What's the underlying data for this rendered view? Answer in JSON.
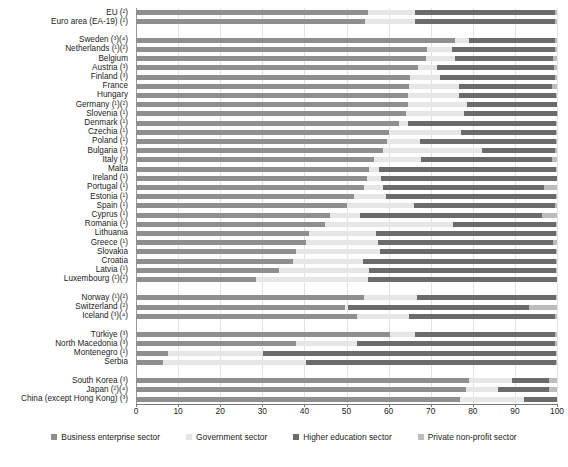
{
  "chart_data": {
    "type": "bar",
    "subtype": "stacked-horizontal-100pct",
    "title": "",
    "xlabel": "",
    "ylabel": "",
    "xlim": [
      0,
      100
    ],
    "xticks": [
      0,
      10,
      20,
      30,
      40,
      50,
      60,
      70,
      80,
      90,
      100
    ],
    "grid": true,
    "legend_position": "bottom",
    "series": [
      {
        "name": "Business enterprise sector",
        "color": "#8f8f8f"
      },
      {
        "name": "Government sector",
        "color": "#e6e6e6"
      },
      {
        "name": "Higher education sector",
        "color": "#6b6b6b"
      },
      {
        "name": "Private non-profit sector",
        "color": "#bdbdbd"
      }
    ],
    "categories": [
      "EU (²)",
      "Euro area (EA-19) (²)",
      "",
      "Sweden (³)(⁴)",
      "Netherlands (¹)(²)",
      "Belgium",
      "Austria (³)",
      "Finland (³)",
      "France",
      "Hungary",
      "Germany (¹)(²)",
      "Slovenia (¹)",
      "Denmark (¹)",
      "Czechia (¹)",
      "Poland (¹)",
      "Bulgaria (¹)",
      "Italy  (³)",
      "Malta",
      "Ireland (¹)",
      "Portugal (¹)",
      "Estonia (¹)",
      "Spain (¹)",
      "Cyprus (¹)",
      "Romania (¹)",
      "Lithuania",
      "Greece (¹)",
      "Slovakia",
      "Croatia",
      "Latvia (¹)",
      "Luxembourg (¹)(²)",
      "",
      "Norway (¹)(²)",
      "Switzerland (²)",
      "Iceland (³)(⁴)",
      "",
      "Türkiye (³)",
      "North Macedonia (³)",
      "Montenegro (¹)",
      "Serbia",
      "",
      "South Korea (³)",
      "Japan (²)(⁴)",
      "China (except Hong Kong) (³)"
    ],
    "rows": [
      {
        "label": "EU (²)",
        "values": [
          55.1,
          11.2,
          33.2,
          0.5
        ],
        "group": "aggregate"
      },
      {
        "label": "Euro area (EA-19) (²)",
        "values": [
          54.4,
          11.9,
          33.2,
          0.5
        ],
        "group": "aggregate"
      },
      {
        "label": "Sweden (³)(⁴)",
        "values": [
          75.7,
          3.4,
          20.5,
          0.4
        ],
        "group": "eu"
      },
      {
        "label": "Netherlands (¹)(²)",
        "values": [
          69.2,
          5.8,
          24.5,
          0.5
        ],
        "group": "eu"
      },
      {
        "label": "Belgium",
        "values": [
          69.0,
          6.8,
          23.2,
          1.0
        ],
        "group": "eu"
      },
      {
        "label": "Austria (³)",
        "values": [
          66.9,
          4.7,
          27.8,
          0.6
        ],
        "group": "eu"
      },
      {
        "label": "Finland (³)",
        "values": [
          65.2,
          6.9,
          27.4,
          0.5
        ],
        "group": "eu"
      },
      {
        "label": "France",
        "values": [
          64.9,
          11.8,
          22.2,
          1.1
        ],
        "group": "eu"
      },
      {
        "label": "Hungary",
        "values": [
          64.6,
          12.1,
          23.0,
          0.3
        ],
        "group": "eu"
      },
      {
        "label": "Germany (¹)(²)",
        "values": [
          64.5,
          14.1,
          21.4,
          0.0
        ],
        "group": "eu"
      },
      {
        "label": "Slovenia (¹)",
        "values": [
          64.2,
          13.7,
          22.0,
          0.1
        ],
        "group": "eu"
      },
      {
        "label": "Denmark (¹)",
        "values": [
          62.4,
          2.3,
          35.0,
          0.3
        ],
        "group": "eu"
      },
      {
        "label": "Czechia (¹)",
        "values": [
          60.0,
          17.3,
          22.4,
          0.3
        ],
        "group": "eu"
      },
      {
        "label": "Poland (¹)",
        "values": [
          59.6,
          7.9,
          32.2,
          0.3
        ],
        "group": "eu"
      },
      {
        "label": "Bulgaria (¹)",
        "values": [
          58.6,
          23.5,
          17.5,
          0.4
        ],
        "group": "eu"
      },
      {
        "label": "Italy  (³)",
        "values": [
          56.5,
          11.2,
          31.0,
          1.3
        ],
        "group": "eu"
      },
      {
        "label": "Malta",
        "values": [
          55.3,
          2.4,
          42.1,
          0.2
        ],
        "group": "eu"
      },
      {
        "label": "Ireland (¹)",
        "values": [
          54.8,
          3.3,
          41.9,
          0.0
        ],
        "group": "eu"
      },
      {
        "label": "Portugal (¹)",
        "values": [
          54.2,
          4.4,
          38.4,
          3.0
        ],
        "group": "eu"
      },
      {
        "label": "Estonia (¹)",
        "values": [
          51.8,
          7.7,
          40.2,
          0.3
        ],
        "group": "eu"
      },
      {
        "label": "Spain (¹)",
        "values": [
          50.1,
          15.9,
          33.6,
          0.4
        ],
        "group": "eu"
      },
      {
        "label": "Cyprus (¹)",
        "values": [
          46.0,
          7.3,
          43.1,
          3.6
        ],
        "group": "eu"
      },
      {
        "label": "Romania (¹)",
        "values": [
          44.8,
          30.6,
          24.4,
          0.2
        ],
        "group": "eu"
      },
      {
        "label": "Lithuania",
        "values": [
          41.0,
          16.0,
          42.7,
          0.3
        ],
        "group": "eu"
      },
      {
        "label": "Greece (¹)",
        "values": [
          40.3,
          17.3,
          41.5,
          0.9
        ],
        "group": "eu"
      },
      {
        "label": "Slovakia",
        "values": [
          38.0,
          20.0,
          41.8,
          0.2
        ],
        "group": "eu"
      },
      {
        "label": "Croatia",
        "values": [
          37.4,
          16.6,
          45.8,
          0.2
        ],
        "group": "eu"
      },
      {
        "label": "Latvia (¹)",
        "values": [
          34.0,
          21.3,
          44.5,
          0.2
        ],
        "group": "eu"
      },
      {
        "label": "Luxembourg (¹)(²)",
        "values": [
          28.6,
          26.4,
          45.0,
          0.0
        ],
        "group": "eu"
      },
      {
        "label": "Norway (¹)(²)",
        "values": [
          54.2,
          12.5,
          33.1,
          0.2
        ],
        "group": "efta"
      },
      {
        "label": "Switzerland (²)",
        "values": [
          49.6,
          0.8,
          43.0,
          6.6
        ],
        "group": "efta"
      },
      {
        "label": "Iceland (³)(⁴)",
        "values": [
          52.4,
          12.4,
          34.8,
          0.4
        ],
        "group": "efta"
      },
      {
        "label": "Türkiye (³)",
        "values": [
          60.4,
          5.8,
          33.4,
          0.4
        ],
        "group": "candidate"
      },
      {
        "label": "North Macedonia (³)",
        "values": [
          38.0,
          14.4,
          47.1,
          0.5
        ],
        "group": "candidate"
      },
      {
        "label": "Montenegro (¹)",
        "values": [
          7.6,
          22.5,
          69.6,
          0.3
        ],
        "group": "candidate"
      },
      {
        "label": "Serbia",
        "values": [
          6.5,
          34.0,
          59.3,
          0.2
        ],
        "group": "candidate"
      },
      {
        "label": "South Korea (³)",
        "values": [
          79.1,
          10.1,
          9.0,
          1.8
        ],
        "group": "other"
      },
      {
        "label": "Japan (²)(⁴)",
        "values": [
          78.5,
          7.6,
          12.0,
          1.9
        ],
        "group": "other"
      },
      {
        "label": "China (except Hong Kong) (³)",
        "values": [
          76.9,
          15.3,
          7.8,
          0.0
        ],
        "group": "other"
      }
    ]
  },
  "legend": {
    "items": [
      "Business enterprise sector",
      "Government sector",
      "Higher education sector",
      "Private non-profit sector"
    ]
  },
  "axis": {
    "tick_labels": [
      "0",
      "10",
      "20",
      "30",
      "40",
      "50",
      "60",
      "70",
      "80",
      "90",
      "100"
    ]
  }
}
